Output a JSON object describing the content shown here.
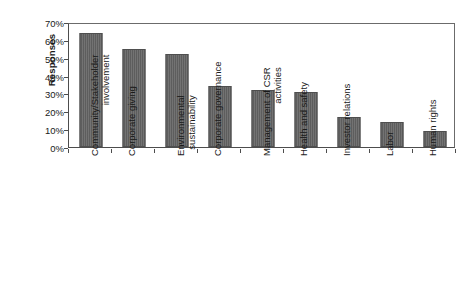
{
  "chart_data": {
    "type": "bar",
    "title": "",
    "subtitle": "",
    "xlabel": "",
    "ylabel": "Responses",
    "ylim": [
      0,
      70
    ],
    "ytick_step": 10,
    "ytick_labels": [
      "70%",
      "60%",
      "50%",
      "40%",
      "30%",
      "20%",
      "10%",
      "0%"
    ],
    "ytick_values": [
      70,
      60,
      50,
      40,
      30,
      20,
      10,
      0
    ],
    "grid": false,
    "legend": null,
    "value_suffix": "%",
    "bar_color": "#636363",
    "bar_border_color": "#4f4f4f",
    "axis_color": "#4d4d4d",
    "text_color": "#1a1a1a",
    "background_color": "#ffffff",
    "categories": [
      "Community/Stakeholder involvement",
      "Corporate giving",
      "Environmental sustainability",
      "Corporate governance",
      "Management of CSR activities",
      "Health and safety",
      "Investor relations",
      "Labor",
      "Human rights"
    ],
    "category_lines": [
      [
        "Community/Stakeholder",
        "involvement"
      ],
      [
        "Corporate giving"
      ],
      [
        "Environmental",
        "sustainability"
      ],
      [
        "Corporate governance"
      ],
      [
        "Management of CSR",
        "activities"
      ],
      [
        "Health and safety"
      ],
      [
        "Investor relations"
      ],
      [
        "Labor"
      ],
      [
        "Human rights"
      ]
    ],
    "values": [
      64,
      55,
      52,
      34,
      32,
      31,
      17,
      14,
      9
    ]
  }
}
